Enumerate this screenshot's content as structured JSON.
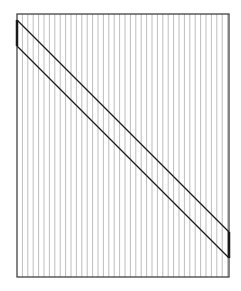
{
  "diagram": {
    "frame": {
      "x": 17,
      "y": 14,
      "width": 212,
      "height": 263,
      "stroke": "#333333",
      "stroke_width": 1.2
    },
    "hatching": {
      "spacing": 5.4,
      "stroke": "#bdbdbd",
      "stroke_width": 1,
      "orientation": "vertical"
    },
    "band": {
      "upper_line": {
        "x1": 17,
        "y1": 20,
        "x2": 229,
        "y2": 232
      },
      "lower_line": {
        "x1": 17,
        "y1": 46,
        "x2": 229,
        "y2": 258
      },
      "stroke": "#1a1a1a",
      "stroke_width": 1.3,
      "left_edge_segment": {
        "x": 17,
        "y1": 20,
        "y2": 46,
        "stroke_width": 2.5
      },
      "right_edge_segment": {
        "x": 229,
        "y1": 232,
        "y2": 258,
        "stroke_width": 2.5
      }
    },
    "colors": {
      "background": "#ffffff",
      "frame": "#333333",
      "hatch": "#bdbdbd",
      "band": "#1a1a1a"
    }
  }
}
